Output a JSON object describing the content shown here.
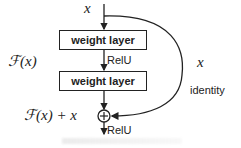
{
  "diagram": {
    "input_label": "x",
    "layers": [
      {
        "label": "weight layer"
      },
      {
        "label": "weight layer"
      }
    ],
    "activation_between": "RelU",
    "activation_after": "RelU",
    "residual_function_label": "ℱ(x)",
    "output_label": "ℱ(x) + x",
    "shortcut_label": "x",
    "shortcut_type": "identity",
    "add_symbol": "+",
    "colors": {
      "stroke": "#222222",
      "background": "#ffffff"
    }
  }
}
